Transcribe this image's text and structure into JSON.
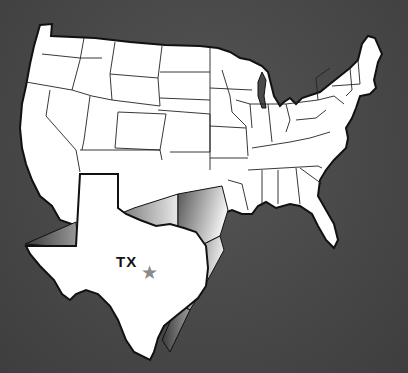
{
  "map": {
    "title": "United States map with Texas highlighted",
    "highlighted_state": {
      "abbr": "TX",
      "label": "TX",
      "marker": "★",
      "marker_meaning": "capital (Austin)"
    },
    "colors": {
      "background": "#4a4a4a",
      "land": "#ffffff",
      "border": "#111111",
      "marker": "#8a8a8a"
    }
  }
}
